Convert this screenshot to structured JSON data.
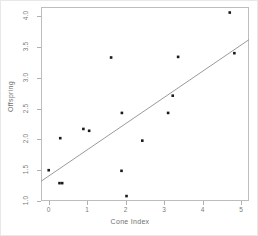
{
  "chart_data": {
    "type": "scatter",
    "title": "",
    "xlabel": "Cone Index",
    "ylabel": "Offspring",
    "xlim": [
      -0.2,
      5.2
    ],
    "ylim": [
      1.0,
      4.15
    ],
    "xticks": [
      "0",
      "1",
      "2",
      "3",
      "4",
      "5"
    ],
    "xtick_values": [
      0,
      1,
      2,
      3,
      4,
      5
    ],
    "yticks": [
      "1.0",
      "1.5",
      "2.0",
      "2.5",
      "3.0",
      "3.5",
      "4.0"
    ],
    "ytick_values": [
      1.0,
      1.5,
      2.0,
      2.5,
      3.0,
      3.5,
      4.0
    ],
    "grid": false,
    "legend": "none",
    "marker": "filled-square",
    "marker_color": "#1a1a1a",
    "points": [
      {
        "x": 0.0,
        "y": 1.5
      },
      {
        "x": 0.28,
        "y": 1.29
      },
      {
        "x": 0.35,
        "y": 1.29
      },
      {
        "x": 0.3,
        "y": 2.02
      },
      {
        "x": 0.9,
        "y": 2.17
      },
      {
        "x": 1.05,
        "y": 2.14
      },
      {
        "x": 1.62,
        "y": 3.33
      },
      {
        "x": 1.89,
        "y": 1.49
      },
      {
        "x": 1.9,
        "y": 2.43
      },
      {
        "x": 2.02,
        "y": 1.08
      },
      {
        "x": 2.43,
        "y": 1.98
      },
      {
        "x": 3.1,
        "y": 2.43
      },
      {
        "x": 3.22,
        "y": 2.71
      },
      {
        "x": 3.36,
        "y": 3.34
      },
      {
        "x": 4.7,
        "y": 4.06
      },
      {
        "x": 4.82,
        "y": 3.4
      }
    ],
    "fit_line": {
      "type": "linear-regression",
      "color": "#9a9a9a",
      "x_start": -0.2,
      "y_start": 1.32,
      "x_end": 5.2,
      "y_end": 3.62
    }
  }
}
